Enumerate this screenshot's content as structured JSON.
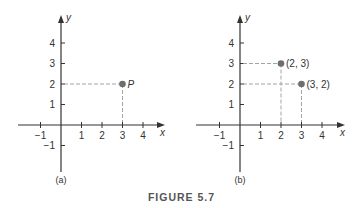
{
  "figure_title": "FIGURE 5.7",
  "colors": {
    "axis": "#333333",
    "point": "#6e6e6e",
    "guide": "#9a9a9a"
  },
  "chart_data": [
    {
      "type": "scatter",
      "caption": "(a)",
      "xlabel": "x",
      "ylabel": "y",
      "xlim": [
        -2,
        4.5
      ],
      "ylim": [
        -2,
        4.8
      ],
      "xticks": [
        -1,
        1,
        2,
        3,
        4
      ],
      "yticks": [
        -1,
        1,
        2,
        3,
        4
      ],
      "grid": false,
      "points": [
        {
          "x": 3,
          "y": 2,
          "label": "P",
          "italic": true
        }
      ]
    },
    {
      "type": "scatter",
      "caption": "(b)",
      "xlabel": "x",
      "ylabel": "y",
      "xlim": [
        -2,
        4.5
      ],
      "ylim": [
        -2,
        4.8
      ],
      "xticks": [
        -1,
        1,
        2,
        3,
        4
      ],
      "yticks": [
        -1,
        1,
        2,
        3,
        4
      ],
      "grid": false,
      "points": [
        {
          "x": 2,
          "y": 3,
          "label": "(2, 3)",
          "italic": false
        },
        {
          "x": 3,
          "y": 2,
          "label": "(3, 2)",
          "italic": false
        }
      ]
    }
  ]
}
